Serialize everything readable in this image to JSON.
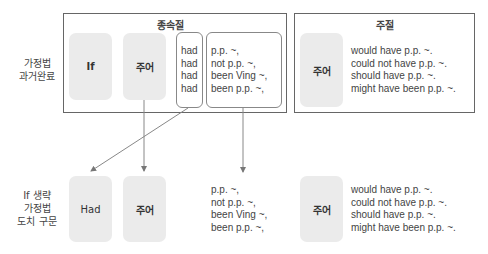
{
  "row_labels": {
    "top": [
      "가정법",
      "과거완료"
    ],
    "bottom": [
      "If 생략",
      "가정법",
      "도치 구문"
    ]
  },
  "subordinate_clause": {
    "title": "종속절",
    "if_box": "If",
    "subject_box": "주어",
    "had_lines": [
      "had",
      "had",
      "had",
      "had"
    ],
    "pp_lines": [
      "p.p. ~,",
      "not p.p. ~,",
      "been Ving ~,",
      "been p.p. ~,"
    ]
  },
  "main_clause": {
    "title": "주절",
    "subject_box": "주어",
    "lines": [
      "would have p.p. ~.",
      "could not have p.p. ~.",
      "should have p.p. ~.",
      "might have been p.p. ~."
    ]
  },
  "inverted": {
    "had_box": "Had",
    "subject_box": "주어",
    "pp_lines": [
      "p.p. ~,",
      "not p.p. ~,",
      "been Ving ~,",
      "been p.p. ~,"
    ],
    "main_subject_box": "주어",
    "main_lines": [
      "would have p.p. ~.",
      "could not have p.p. ~.",
      "should have p.p. ~.",
      "might have been p.p. ~."
    ]
  },
  "colors": {
    "frame": "#666666",
    "gray_box": "#ebebeb",
    "arrow": "#777777"
  }
}
